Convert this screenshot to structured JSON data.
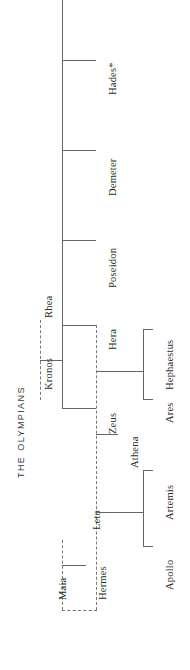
{
  "title": "The Olympians",
  "orientation": "rotated-90-ccw",
  "footnote_marker": "*",
  "nodes": {
    "kronos": "Kronos",
    "rhea": "Rhea",
    "hades": "Hades*",
    "demeter": "Demeter",
    "poseidon": "Poseidon",
    "hera": "Hera",
    "zeus": "Zeus",
    "hephaestus": "Hephaestus",
    "ares": "Ares",
    "athena": "Athena",
    "artemis": "Artemis",
    "apollo": "Apollo",
    "leto": "Leto",
    "maia": "Maia",
    "hermes": "Hermes"
  },
  "relationships": {
    "marriages": [
      {
        "a": "Kronos",
        "b": "Rhea",
        "style": "dashed"
      },
      {
        "a": "Zeus",
        "b": "Hera",
        "style": "dashed"
      },
      {
        "a": "Zeus",
        "b": "Leto",
        "style": "dashed"
      },
      {
        "a": "Zeus",
        "b": "Maia",
        "style": "dashed"
      }
    ],
    "children": [
      {
        "parents": "Kronos + Rhea",
        "offspring": [
          "Hades*",
          "Demeter",
          "Poseidon",
          "Hera",
          "Zeus"
        ]
      },
      {
        "parents": "Zeus + Hera",
        "offspring": [
          "Hephaestus",
          "Ares"
        ]
      },
      {
        "parents": "Zeus",
        "offspring": [
          "Athena"
        ]
      },
      {
        "parents": "Zeus + Leto",
        "offspring": [
          "Artemis",
          "Apollo"
        ]
      },
      {
        "parents": "Zeus + Maia",
        "offspring": [
          "Hermes"
        ]
      }
    ]
  },
  "colors": {
    "line": "#666666",
    "dashed_line": "#777777",
    "text": "#2b2b2b",
    "title_text": "#3a3a3a",
    "background": "#ffffff"
  }
}
